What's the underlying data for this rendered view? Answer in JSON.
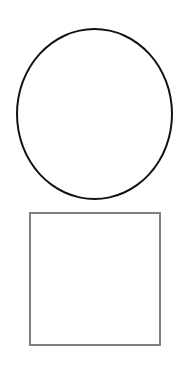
{
  "canvas": {
    "width": 188,
    "height": 367,
    "background_color": "#ffffff",
    "title": "Shapes"
  },
  "shapes": [
    {
      "id": "circle",
      "name": "circle",
      "kind": "outline-circle",
      "label": "Circle",
      "stroke_color": "#121212",
      "fill_color": "none",
      "stroke_width": 2.5,
      "x": 16,
      "y": 28,
      "width": 157,
      "height": 172
    },
    {
      "id": "square",
      "name": "square",
      "kind": "outline-square",
      "label": "Square",
      "stroke_color": "#808080",
      "fill_color": "none",
      "stroke_width": 2,
      "x": 29,
      "y": 212,
      "width": 132,
      "height": 134
    }
  ]
}
